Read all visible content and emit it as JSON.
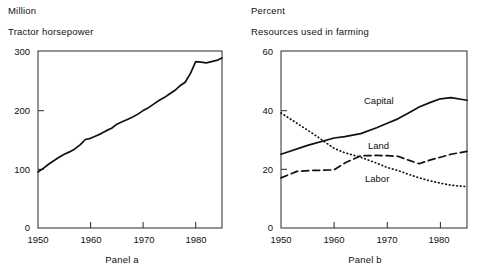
{
  "figure": {
    "panels": [
      {
        "id": "panel-a",
        "caption": "Panel a",
        "unit_label": "Million",
        "series_title": "Tractor horsepower",
        "y_ticks": [
          "0",
          "100",
          "200",
          "300"
        ],
        "x_ticks": [
          "1950",
          "1960",
          "1970",
          "1980"
        ]
      },
      {
        "id": "panel-b",
        "caption": "Panel b",
        "unit_label": "Percent",
        "series_title": "Resources used in farming",
        "y_ticks": [
          "0",
          "20",
          "40",
          "60"
        ],
        "x_ticks": [
          "1950",
          "1960",
          "1970",
          "1980"
        ],
        "curve_labels": {
          "capital": "Capital",
          "land": "Land",
          "labor": "Labor"
        }
      }
    ]
  },
  "chart_data": [
    {
      "type": "line",
      "id": "panel-a",
      "title": "Tractor horsepower",
      "subtitle": "Million",
      "caption": "Panel a",
      "xlabel": "",
      "ylabel": "Million",
      "xlim": [
        1950,
        1985
      ],
      "ylim": [
        0,
        300
      ],
      "yticks": [
        0,
        100,
        200,
        300
      ],
      "xticks": [
        1950,
        1960,
        1970,
        1980
      ],
      "grid": false,
      "legend": "none",
      "series": [
        {
          "name": "Tractor horsepower",
          "style": "solid",
          "color": "#111111",
          "x": [
            1950,
            1951,
            1952,
            1953,
            1954,
            1955,
            1956,
            1957,
            1958,
            1959,
            1960,
            1961,
            1962,
            1963,
            1964,
            1965,
            1966,
            1967,
            1968,
            1969,
            1970,
            1971,
            1972,
            1973,
            1974,
            1975,
            1976,
            1977,
            1978,
            1979,
            1980,
            1981,
            1982,
            1983,
            1984,
            1985
          ],
          "y": [
            95,
            101,
            108,
            114,
            120,
            125,
            129,
            134,
            141,
            150,
            152,
            156,
            160,
            165,
            169,
            176,
            180,
            184,
            188,
            193,
            199,
            204,
            210,
            216,
            221,
            227,
            233,
            241,
            247,
            262,
            282,
            281,
            280,
            282,
            284,
            288
          ]
        }
      ]
    },
    {
      "type": "line",
      "id": "panel-b",
      "title": "Resources used in farming",
      "subtitle": "Percent",
      "caption": "Panel b",
      "xlabel": "",
      "ylabel": "Percent",
      "xlim": [
        1950,
        1985
      ],
      "ylim": [
        0,
        60
      ],
      "yticks": [
        0,
        20,
        40,
        60
      ],
      "xticks": [
        1950,
        1960,
        1970,
        1980
      ],
      "grid": false,
      "legend": "inline-annotations",
      "series": [
        {
          "name": "Capital",
          "style": "solid",
          "color": "#111111",
          "x": [
            1950,
            1955,
            1960,
            1962,
            1965,
            1968,
            1970,
            1972,
            1974,
            1976,
            1978,
            1980,
            1982,
            1985
          ],
          "y": [
            25,
            28,
            30.5,
            31,
            32,
            34,
            35.5,
            37,
            39,
            41,
            42.5,
            43.8,
            44.2,
            43.3
          ]
        },
        {
          "name": "Land",
          "style": "dashed",
          "color": "#111111",
          "x": [
            1950,
            1953,
            1956,
            1960,
            1962,
            1965,
            1968,
            1970,
            1972,
            1974,
            1976,
            1978,
            1980,
            1982,
            1985
          ],
          "y": [
            17,
            19.2,
            19.5,
            19.7,
            22,
            24.5,
            24.6,
            24.5,
            24.3,
            23,
            21.8,
            23,
            24,
            25,
            26
          ]
        },
        {
          "name": "Labor",
          "style": "dotted",
          "color": "#111111",
          "x": [
            1950,
            1953,
            1956,
            1958,
            1960,
            1962,
            1965,
            1968,
            1970,
            1972,
            1974,
            1976,
            1978,
            1980,
            1982,
            1985
          ],
          "y": [
            39,
            35.5,
            32,
            29.5,
            27,
            25.5,
            24,
            22,
            20.5,
            19.5,
            18.2,
            17,
            16,
            15.2,
            14.5,
            14
          ]
        }
      ]
    }
  ]
}
